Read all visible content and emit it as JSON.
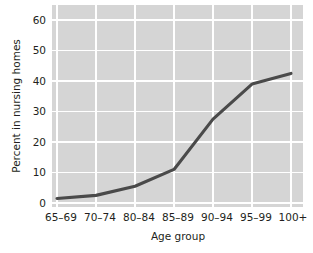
{
  "chart_data": {
    "type": "line",
    "title": "",
    "xlabel": "Age group",
    "ylabel": "Percent in nursing homes",
    "categories": [
      "65–69",
      "70–74",
      "80–84",
      "85–89",
      "90–94",
      "95–99",
      "100+"
    ],
    "values": [
      1.5,
      2.5,
      5.5,
      11,
      27.5,
      39,
      42.5
    ],
    "series": [
      {
        "name": "Percent in nursing homes",
        "values": [
          1.5,
          2.5,
          5.5,
          11,
          27.5,
          39,
          42.5
        ]
      }
    ],
    "ylim": [
      0,
      63
    ],
    "yticks": [
      0,
      10,
      20,
      30,
      40,
      50,
      60
    ],
    "ytick_labels": [
      "0",
      "10",
      "20",
      "30",
      "40",
      "50",
      "60"
    ],
    "xtick_labels": [
      "65–69",
      "70–74",
      "80–84",
      "85–89",
      "90–94",
      "95–99",
      "100+"
    ],
    "grid": true,
    "legend": "none",
    "colors": {
      "line": "#4a4a4a",
      "plot_background": "#d5d5d5",
      "gridline": "#ffffff",
      "text": "#231f20",
      "figure_background": "#ffffff"
    }
  }
}
